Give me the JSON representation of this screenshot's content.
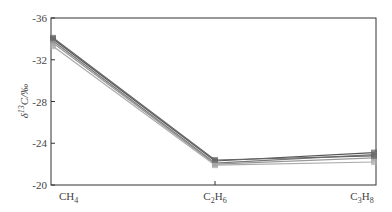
{
  "chart_data": {
    "type": "line",
    "title": "",
    "xlabel": "",
    "ylabel": "δ13C/‰",
    "ylabel_parts": {
      "delta": "δ",
      "sup": "13",
      "rest": "C/‰"
    },
    "categories": [
      "CH4",
      "C2H6",
      "C3H8"
    ],
    "category_labels": [
      {
        "base": "CH",
        "sub": "4"
      },
      {
        "base": "C",
        "sub1": "2",
        "mid": "H",
        "sub2": "6"
      },
      {
        "base": "C",
        "sub1": "3",
        "mid": "H",
        "sub2": "8"
      }
    ],
    "ylim": [
      -20,
      -36
    ],
    "y_inverted": true,
    "yticks": [
      -36,
      -32,
      -28,
      -24,
      -20
    ],
    "ytick_labels": [
      "-36",
      "-32",
      "-28",
      "-24",
      "-20"
    ],
    "grid": false,
    "legend": null,
    "series": [
      {
        "name": "sample-1",
        "values": [
          -34.0,
          -22.3,
          -23.1
        ],
        "color": "#555555"
      },
      {
        "name": "sample-2",
        "values": [
          -33.8,
          -22.1,
          -22.9
        ],
        "color": "#777777"
      },
      {
        "name": "sample-3",
        "values": [
          -33.6,
          -22.0,
          -22.6
        ],
        "color": "#999999"
      },
      {
        "name": "sample-4",
        "values": [
          -33.3,
          -21.9,
          -22.2
        ],
        "color": "#aaaaaa"
      },
      {
        "name": "sample-5",
        "values": [
          -34.1,
          -22.4,
          -22.8
        ],
        "color": "#666666"
      }
    ]
  }
}
